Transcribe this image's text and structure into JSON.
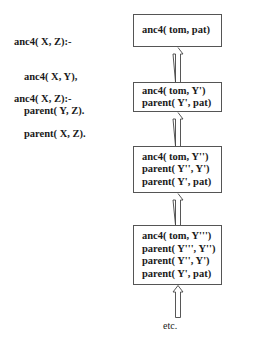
{
  "program": {
    "clauses": [
      {
        "head": "anc4( X, Z):-",
        "body": [
          "anc4( X, Y),",
          "parent( Y, Z)."
        ]
      },
      {
        "head": "anc4( X, Z):-",
        "body": [
          "parent( X, Z)."
        ]
      }
    ]
  },
  "derivation": {
    "boxes": [
      {
        "goals": [
          "anc4( tom, pat)"
        ]
      },
      {
        "goals": [
          "anc4( tom, Y')",
          "parent( Y', pat)"
        ]
      },
      {
        "goals": [
          "anc4( tom, Y'')",
          "parent( Y'', Y')",
          "parent( Y', pat)"
        ]
      },
      {
        "goals": [
          "anc4( tom, Y''')",
          "parent( Y''', Y'')",
          "parent( Y'', Y')",
          "parent( Y', pat)"
        ]
      }
    ],
    "continuation_label": "etc."
  }
}
